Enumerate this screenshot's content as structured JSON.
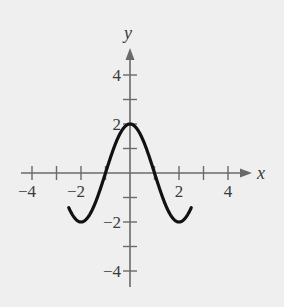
{
  "chart_data": {
    "type": "line",
    "title": "",
    "xlabel": "x",
    "ylabel": "y",
    "xlim": [
      -4.5,
      5
    ],
    "ylim": [
      -4.5,
      5
    ],
    "grid": false,
    "legend": null,
    "x_ticks": [
      -4,
      -3,
      -2,
      -1,
      0,
      1,
      2,
      3,
      4
    ],
    "y_ticks": [
      -4,
      -3,
      -2,
      -1,
      0,
      1,
      2,
      3,
      4
    ],
    "x_tick_labels": [
      {
        "value": -4,
        "label": "−4"
      },
      {
        "value": -2,
        "label": "−2"
      },
      {
        "value": 2,
        "label": "2"
      },
      {
        "value": 4,
        "label": "4"
      }
    ],
    "y_tick_labels": [
      {
        "value": 4,
        "label": "4"
      },
      {
        "value": 2,
        "label": "2"
      },
      {
        "value": -2,
        "label": "−2"
      },
      {
        "value": -4,
        "label": "−4"
      }
    ],
    "series": [
      {
        "name": "y = 2cos(πx/2)",
        "x": [
          -2.5,
          -2.25,
          -2,
          -1.75,
          -1.5,
          -1.25,
          -1,
          -0.75,
          -0.5,
          -0.25,
          0,
          0.25,
          0.5,
          0.75,
          1,
          1.25,
          1.5,
          1.75,
          2,
          2.25,
          2.5
        ],
        "y": [
          -1.41,
          -1.85,
          -2,
          -1.85,
          -1.41,
          -0.77,
          0,
          0.77,
          1.41,
          1.85,
          2,
          1.85,
          1.41,
          0.77,
          0,
          -0.77,
          -1.41,
          -1.85,
          -2,
          -1.85,
          -1.41
        ]
      }
    ]
  },
  "labels": {
    "x_axis": "x",
    "y_axis": "y"
  }
}
